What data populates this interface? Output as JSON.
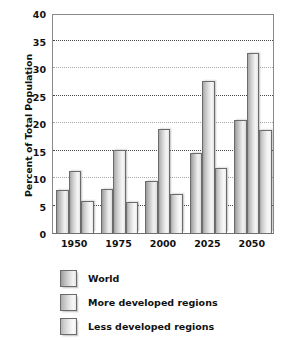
{
  "chart_data": {
    "type": "bar",
    "title": "",
    "xlabel": "",
    "ylabel": "Percent of Total Population",
    "categories": [
      "1950",
      "1975",
      "2000",
      "2025",
      "2050"
    ],
    "series": [
      {
        "name": "World",
        "values": [
          7.9,
          8.0,
          9.5,
          14.5,
          20.5
        ]
      },
      {
        "name": "More developed regions",
        "values": [
          11.2,
          15.1,
          19.0,
          27.7,
          32.7
        ]
      },
      {
        "name": "Less developed regions",
        "values": [
          5.9,
          5.7,
          7.1,
          11.9,
          18.8
        ]
      }
    ],
    "ylim": [
      0,
      40
    ],
    "ytick_values": [
      0,
      5,
      10,
      15,
      20,
      25,
      30,
      35,
      40
    ],
    "ytick_labels": [
      "0",
      "5",
      "10",
      "15",
      "20",
      "25",
      "30",
      "35",
      "40"
    ],
    "grid": true,
    "grid_axis": "y",
    "legend_position": "below-left",
    "colors": {
      "bar_fill_light": "#f2f2f2",
      "bar_fill_dark": "#9a9a9a",
      "bar_border": "#6b6b6b",
      "axis": "#8a8a8a",
      "gridline": "#4a4a4a",
      "text": "#111111",
      "background": "#ffffff"
    }
  },
  "legend": {
    "items": [
      {
        "label": "World"
      },
      {
        "label": "More developed regions"
      },
      {
        "label": "Less developed regions"
      }
    ]
  }
}
